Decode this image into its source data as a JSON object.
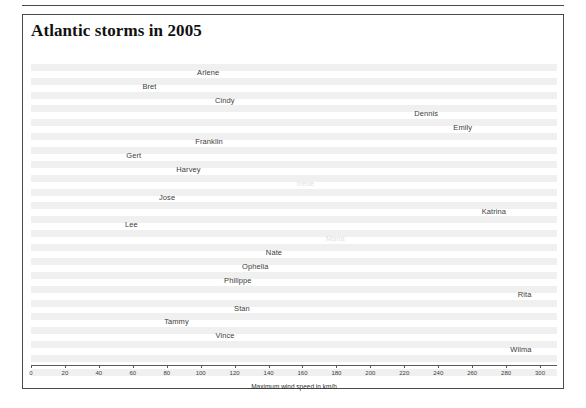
{
  "figure": {
    "title": "Atlantic storms in 2005",
    "axis_title": "Maximum wind speed in km/h"
  },
  "chart_data": {
    "type": "bar",
    "orientation": "horizontal",
    "title": "Atlantic storms in 2005",
    "xlabel": "Maximum wind speed in km/h",
    "ylabel": "",
    "xlim": [
      0,
      310
    ],
    "grid": false,
    "legend": null,
    "xticks": [
      0,
      20,
      40,
      60,
      80,
      100,
      120,
      140,
      160,
      180,
      200,
      220,
      240,
      260,
      280,
      300
    ],
    "categories": [
      "Arlene",
      "Bret",
      "Cindy",
      "Dennis",
      "Emily",
      "Franklin",
      "Gert",
      "Harvey",
      "Irene",
      "Jose",
      "Katrina",
      "Lee",
      "Maria",
      "Nate",
      "Ophelia",
      "Philippe",
      "Rita",
      "Stan",
      "Tammy",
      "Vince",
      "Wilma"
    ],
    "values": [
      111,
      74,
      120,
      240,
      260,
      113,
      65,
      100,
      167,
      85,
      280,
      63,
      185,
      148,
      140,
      130,
      295,
      129,
      93,
      120,
      295
    ],
    "faint_labels": [
      "Irene",
      "Maria"
    ]
  }
}
